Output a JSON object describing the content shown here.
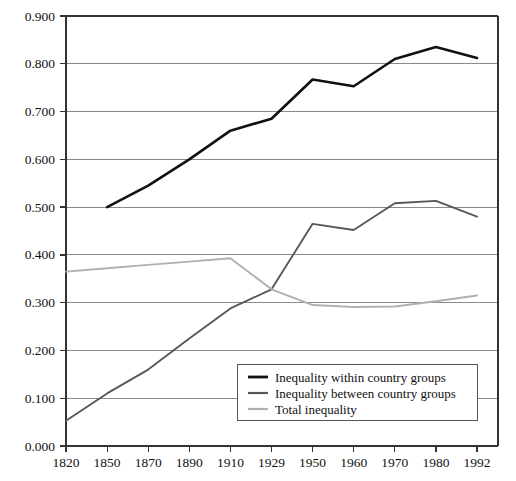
{
  "chart_data": {
    "type": "line",
    "title": "",
    "subtitle": "",
    "xlabel": "",
    "ylabel": "",
    "grid": true,
    "legend_position": "inside-bottom-center",
    "categories": [
      "1820",
      "1850",
      "1870",
      "1890",
      "1910",
      "1929",
      "1950",
      "1960",
      "1970",
      "1980",
      "1992"
    ],
    "ylim": [
      0.0,
      0.9
    ],
    "yticks": [
      "0.000",
      "0.100",
      "0.200",
      "0.300",
      "0.400",
      "0.500",
      "0.600",
      "0.700",
      "0.800",
      "0.900"
    ],
    "ytick_values": [
      0.0,
      0.1,
      0.2,
      0.3,
      0.4,
      0.5,
      0.6,
      0.7,
      0.8,
      0.9
    ],
    "series": [
      {
        "name": "Inequality within country groups",
        "color": "#111111",
        "x": [
          "1850",
          "1870",
          "1890",
          "1910",
          "1929",
          "1950",
          "1960",
          "1970",
          "1980",
          "1992"
        ],
        "values": [
          0.5,
          0.545,
          0.6,
          0.66,
          0.685,
          0.767,
          0.753,
          0.81,
          0.835,
          0.812
        ]
      },
      {
        "name": "Inequality between country groups",
        "color": "#585858",
        "x": [
          "1820",
          "1850",
          "1870",
          "1890",
          "1910",
          "1929",
          "1950",
          "1960",
          "1970",
          "1980",
          "1992"
        ],
        "values": [
          0.053,
          0.11,
          0.16,
          0.225,
          0.288,
          0.328,
          0.465,
          0.452,
          0.508,
          0.513,
          0.48
        ]
      },
      {
        "name": "Total inequality",
        "color": "#b0b0b0",
        "x": [
          "1820",
          "1850",
          "1870",
          "1890",
          "1910",
          "1929",
          "1950",
          "1960",
          "1970",
          "1980",
          "1992"
        ],
        "values": [
          0.365,
          0.372,
          0.379,
          0.386,
          0.393,
          0.328,
          0.295,
          0.291,
          0.292,
          0.303,
          0.315
        ]
      }
    ]
  },
  "legend": {
    "items": [
      {
        "label": "Inequality within country groups",
        "color": "#111111"
      },
      {
        "label": "Inequality between country groups",
        "color": "#585858"
      },
      {
        "label": "Total inequality",
        "color": "#b0b0b0"
      }
    ]
  },
  "axes": {
    "y_tick_labels": [
      "0.900",
      "0.800",
      "0.700",
      "0.600",
      "0.500",
      "0.400",
      "0.300",
      "0.200",
      "0.100",
      "0.000"
    ],
    "x_tick_labels": [
      "1820",
      "1850",
      "1870",
      "1890",
      "1910",
      "1929",
      "1950",
      "1960",
      "1970",
      "1980",
      "1992"
    ]
  },
  "colors": {
    "grid": "#8a8a8a",
    "axis": "#333333",
    "background": "#ffffff"
  }
}
